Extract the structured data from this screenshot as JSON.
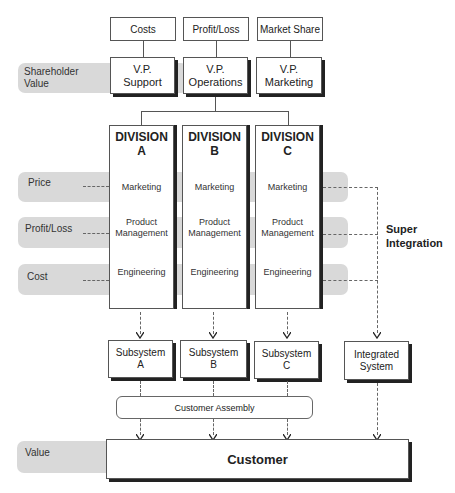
{
  "diagram": {
    "top_metrics": [
      {
        "label": "Costs"
      },
      {
        "label": "Profit/Loss"
      },
      {
        "label": "Market Share"
      }
    ],
    "shareholder_band": {
      "label_line1": "Shareholder",
      "label_line2": "Value"
    },
    "vps": [
      {
        "line1": "V.P.",
        "line2": "Support"
      },
      {
        "line1": "V.P.",
        "line2": "Operations"
      },
      {
        "line1": "V.P.",
        "line2": "Marketing"
      }
    ],
    "divisions": [
      {
        "title": "DIVISION",
        "letter": "A",
        "functions": {
          "marketing": "Marketing",
          "pm_line1": "Product",
          "pm_line2": "Management",
          "engineering": "Engineering"
        }
      },
      {
        "title": "DIVISION",
        "letter": "B",
        "functions": {
          "marketing": "Marketing",
          "pm_line1": "Product",
          "pm_line2": "Management",
          "engineering": "Engineering"
        }
      },
      {
        "title": "DIVISION",
        "letter": "C",
        "functions": {
          "marketing": "Marketing",
          "pm_line1": "Product",
          "pm_line2": "Management",
          "engineering": "Engineering"
        }
      }
    ],
    "left_bands": [
      {
        "label": "Price"
      },
      {
        "label": "Profit/Loss"
      },
      {
        "label": "Cost"
      }
    ],
    "super_integration": {
      "line1": "Super",
      "line2": "Integration"
    },
    "subsystems": [
      {
        "line1": "Subsystem",
        "line2": "A"
      },
      {
        "line1": "Subsystem",
        "line2": "B"
      },
      {
        "line1": "Subsystem",
        "line2": "C"
      }
    ],
    "integrated_system": {
      "line1": "Integrated",
      "line2": "System"
    },
    "customer_assembly": {
      "label": "Customer Assembly"
    },
    "value_band": {
      "label": "Value"
    },
    "customer": {
      "label": "Customer"
    }
  }
}
